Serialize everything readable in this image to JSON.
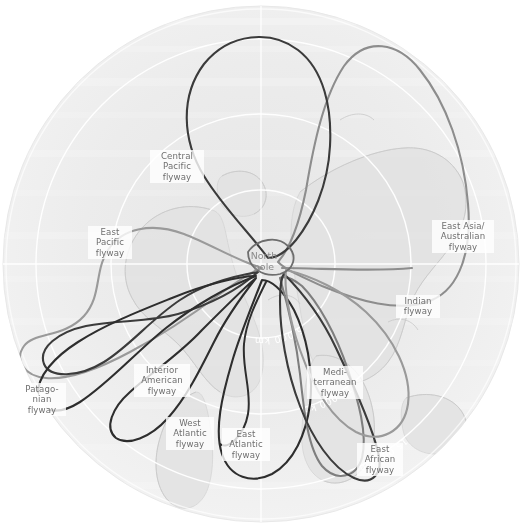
{
  "figure": {
    "type": "polar-projection-map",
    "projection": "azimuthal north-polar",
    "center_label": "North\npole",
    "globe": {
      "center_x": 261,
      "center_y": 264,
      "radius": 258,
      "fill": "#f0f0f0",
      "edge": "#e4e4e4"
    },
    "background_color": "#ffffff",
    "land_outline_color": "#cccccc",
    "graticule_color": "#ffffff"
  },
  "distance_rings": [
    {
      "id": "ring-5000",
      "label": "5 000 km",
      "radius": 74,
      "label_angle": -131
    },
    {
      "id": "ring-10000",
      "label": "10 000 km",
      "radius": 150,
      "label_angle": -137
    },
    {
      "id": "ring-15000",
      "label": "15 000 km",
      "radius": 225,
      "label_angle": -142
    }
  ],
  "flyways": [
    {
      "id": "central-pacific",
      "label": "Central\nPacific\nflyway",
      "color": "#3b3b3b",
      "label_left": 150,
      "label_top": 150,
      "label_width": 54
    },
    {
      "id": "east-pacific",
      "label": "East\nPacific\nflyway",
      "color": "#9a9a9a",
      "label_left": 88,
      "label_top": 226,
      "label_width": 44
    },
    {
      "id": "east-asia-australian",
      "label": "East Asia/\nAustralian\nflyway",
      "color": "#8d8d8d",
      "label_left": 432,
      "label_top": 220,
      "label_width": 60
    },
    {
      "id": "indian",
      "label": "Indian\nflyway",
      "color": "#9a9a9a",
      "label_left": 396,
      "label_top": 295,
      "label_width": 44
    },
    {
      "id": "mediterranean",
      "label": "Medi-\nterranean\nflyway",
      "color": "#7e7e7e",
      "label_left": 307,
      "label_top": 366,
      "label_width": 56
    },
    {
      "id": "east-african",
      "label": "East\nAfrican\nflyway",
      "color": "#3b3b3b",
      "label_left": 357,
      "label_top": 443,
      "label_width": 46
    },
    {
      "id": "east-atlantic",
      "label": "East\nAtlantic\nflyway",
      "color": "#2e2e2e",
      "label_left": 222,
      "label_top": 428,
      "label_width": 48
    },
    {
      "id": "west-atlantic",
      "label": "West\nAtlantic\nflyway",
      "color": "#2e2e2e",
      "label_left": 166,
      "label_top": 417,
      "label_width": 48
    },
    {
      "id": "interior-american",
      "label": "Interior\nAmerican\nflyway",
      "color": "#3b3b3b",
      "label_left": 134,
      "label_top": 364,
      "label_width": 56
    },
    {
      "id": "patagonian",
      "label": "Patago-\nnian\nflyway",
      "color": "#2e2e2e",
      "label_left": 18,
      "label_top": 383,
      "label_width": 48
    }
  ]
}
